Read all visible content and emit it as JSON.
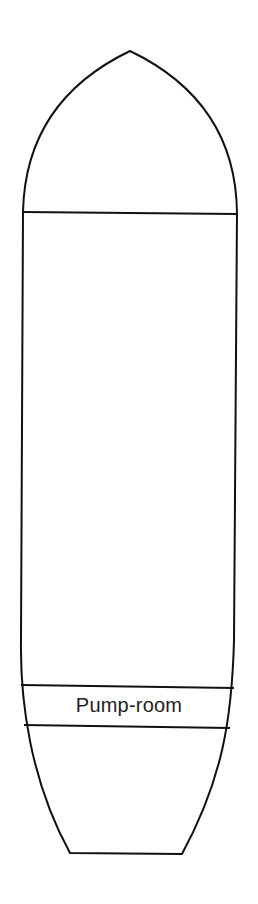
{
  "diagram": {
    "type": "tanker-hull-plan",
    "compartments": [
      {
        "id": "bow",
        "label": ""
      },
      {
        "id": "cargo-tanks",
        "label": ""
      },
      {
        "id": "pump-room",
        "label": "Pump-room"
      },
      {
        "id": "stern",
        "label": ""
      }
    ],
    "colors": {
      "stroke": "#111111",
      "fill": "#ffffff",
      "text": "#222222"
    }
  }
}
